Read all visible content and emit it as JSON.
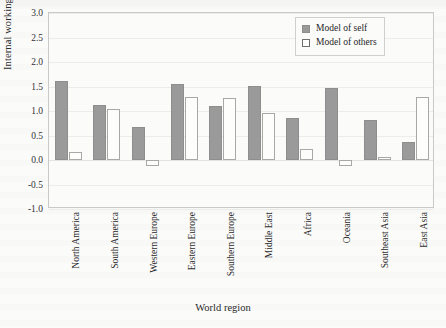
{
  "chart_data": {
    "type": "bar",
    "title": "",
    "xlabel": "World region",
    "ylabel": "Internal working models",
    "ylim": [
      -1.0,
      3.0
    ],
    "yticks": [
      "3.0",
      "2.5",
      "2.0",
      "1.5",
      "1.0",
      "0.5",
      "0.0",
      "-0.5",
      "-1.0"
    ],
    "ytick_values": [
      3.0,
      2.5,
      2.0,
      1.5,
      1.0,
      0.5,
      0.0,
      -0.5,
      -1.0
    ],
    "grid": true,
    "legend_position": "top-right",
    "categories": [
      "North America",
      "South America",
      "Western Europe",
      "Eastern Europe",
      "Southern Europe",
      "Middle East",
      "Africa",
      "Oceania",
      "Southeast Asia",
      "East Asia"
    ],
    "series": [
      {
        "name": "Model of self",
        "color": "#9a9a9a",
        "values": [
          1.62,
          1.13,
          0.68,
          1.55,
          1.1,
          1.52,
          0.85,
          1.47,
          0.82,
          0.37
        ]
      },
      {
        "name": "Model of others",
        "color": "#ffffff",
        "values": [
          0.17,
          1.05,
          -0.12,
          1.28,
          1.27,
          0.95,
          0.22,
          -0.12,
          0.07,
          1.28
        ]
      }
    ]
  },
  "legend": {
    "items": [
      {
        "label": "Model of self",
        "swatch": "filled-gray-swatch"
      },
      {
        "label": "Model of others",
        "swatch": "outline-white-swatch"
      }
    ]
  }
}
